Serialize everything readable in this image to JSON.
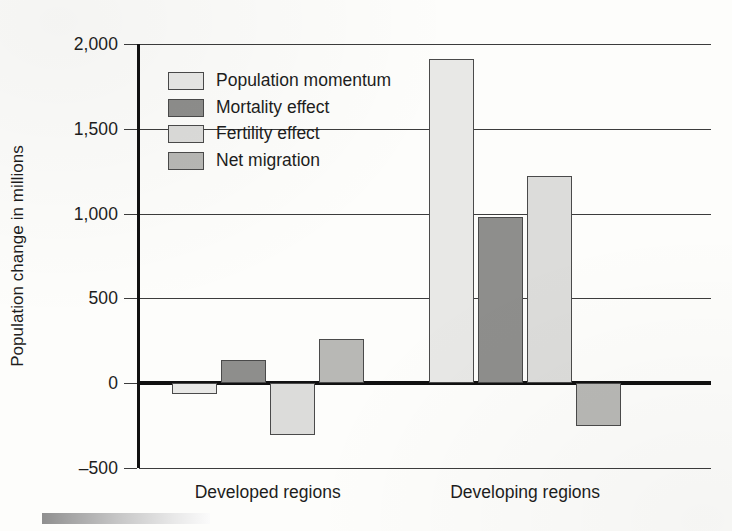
{
  "chart_data": {
    "type": "bar",
    "title": "",
    "xlabel": "",
    "ylabel": "Population change in millions",
    "ylim": [
      -500,
      2000
    ],
    "ytick_values": [
      2000,
      1500,
      1000,
      500,
      0,
      -500
    ],
    "ytick_labels": [
      "2,000",
      "1,500",
      "1,000",
      "500",
      "0",
      "–500"
    ],
    "grid": true,
    "legend_position": "inside upper-left",
    "categories": [
      "Developed regions",
      "Developing regions"
    ],
    "series": [
      {
        "name": "Population momentum",
        "color": "#e8e8e6",
        "values": [
          -65,
          1910
        ]
      },
      {
        "name": "Mortality effect",
        "color": "#8e8e8c",
        "values": [
          135,
          980
        ]
      },
      {
        "name": "Fertility effect",
        "color": "#dcdcda",
        "values": [
          -305,
          1220
        ]
      },
      {
        "name": "Net migration",
        "color": "#b8b8b5",
        "values": [
          260,
          -250
        ]
      }
    ]
  },
  "axis": {
    "zero_line_color": "#111111",
    "grid_color": "#3c3c3c",
    "text_color": "#1d1d1d"
  },
  "artifact": {
    "scan_strip_name": "scan-gradient-strip"
  }
}
